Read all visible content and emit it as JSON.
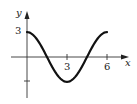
{
  "chart_data": {
    "type": "line",
    "title": "",
    "xlabel": "x",
    "ylabel": "y",
    "x_ticks": [
      "3",
      "6"
    ],
    "y_ticks": [
      "3",
      "-3"
    ],
    "y_tick_labels_shown": [
      "3"
    ],
    "xlim": [
      -0.4,
      6.5
    ],
    "ylim": [
      -4.2,
      4.5
    ],
    "grid": false,
    "legend": null,
    "series": [
      {
        "name": "y = 3cos(πx/3)",
        "x": [
          0,
          0.5,
          1,
          1.5,
          2,
          2.5,
          3,
          3.5,
          4,
          4.5,
          5,
          5.5,
          6
        ],
        "y": [
          3,
          2.6,
          1.5,
          0,
          -1.5,
          -2.6,
          -3,
          -2.6,
          -1.5,
          0,
          1.5,
          2.6,
          3
        ]
      }
    ]
  },
  "labels": {
    "y_axis": "y",
    "x_axis": "x",
    "y_tick_3": "3",
    "x_tick_3": "3",
    "x_tick_6": "6"
  }
}
